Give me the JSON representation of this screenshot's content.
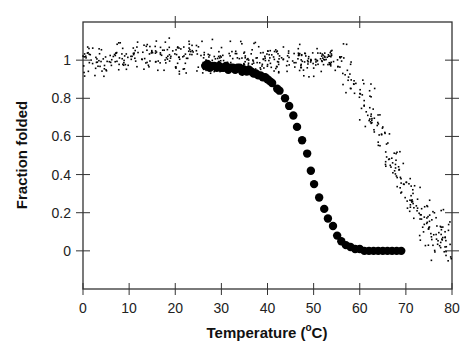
{
  "chart_data": {
    "type": "scatter",
    "title": "",
    "xlabel": "Temperature (°C)",
    "xlabel_parts": {
      "pre": "Temperature (",
      "sup": "o",
      "post": "C)"
    },
    "ylabel": "Fraction folded",
    "xlim": [
      0,
      80
    ],
    "ylim": [
      -0.2,
      1.2
    ],
    "xticks": [
      0,
      10,
      20,
      30,
      40,
      50,
      60,
      70,
      80
    ],
    "yticks": [
      0,
      0.2,
      0.4,
      0.6,
      0.8,
      1
    ],
    "ytick_labels": [
      "0",
      "0.2",
      "0.4",
      "0.6",
      "0.8",
      "1"
    ],
    "grid": false,
    "legend": null,
    "series": [
      {
        "name": "large-dots",
        "marker": "filled-circle-large",
        "color": "#000000",
        "x": [
          26.5,
          27.0,
          27.5,
          28.0,
          28.5,
          29.0,
          29.5,
          30.0,
          30.5,
          31.0,
          31.5,
          32.0,
          32.5,
          33.0,
          33.5,
          34.0,
          34.5,
          35.0,
          35.5,
          36.0,
          36.5,
          37.0,
          37.5,
          38.0,
          38.5,
          39.0,
          39.5,
          40.0,
          40.5,
          41.0,
          42.1,
          42.6,
          43.8,
          44.7,
          45.6,
          46.4,
          47.5,
          48.6,
          49.4,
          50.1,
          51.2,
          52.3,
          53.1,
          54.2,
          55.1,
          56.0,
          57.0,
          58.0,
          59.0,
          60.0,
          61.0,
          62.0,
          63.0,
          64.0,
          65.0,
          66.0,
          67.0,
          68.0,
          69.0
        ],
        "y": [
          0.97,
          0.98,
          0.96,
          0.97,
          0.97,
          0.96,
          0.97,
          0.96,
          0.96,
          0.97,
          0.95,
          0.96,
          0.96,
          0.95,
          0.96,
          0.96,
          0.94,
          0.95,
          0.94,
          0.95,
          0.94,
          0.93,
          0.93,
          0.92,
          0.92,
          0.91,
          0.91,
          0.9,
          0.89,
          0.88,
          0.85,
          0.84,
          0.8,
          0.76,
          0.71,
          0.65,
          0.58,
          0.51,
          0.42,
          0.35,
          0.28,
          0.22,
          0.17,
          0.13,
          0.08,
          0.05,
          0.03,
          0.02,
          0.01,
          0.01,
          0.0,
          0.0,
          0.0,
          0.0,
          0.0,
          0.0,
          0.0,
          0.0,
          0.0
        ]
      },
      {
        "name": "small-dots",
        "marker": "point-small",
        "color": "#000000",
        "description": "noisy melting curve, plateau ~1.0 to ~55 °C then sigmoidal decay to ~0 near 80 °C",
        "x_range": [
          0,
          80
        ],
        "n_points": 640,
        "midpoint_T": 67.5,
        "slope_width": 4.2,
        "noise_sd_plateau": 0.04,
        "noise_sd_transition": 0.07,
        "curve_samples": {
          "x": [
            0,
            10,
            20,
            30,
            40,
            50,
            55,
            58,
            60,
            62,
            64,
            66,
            68,
            70,
            72,
            74,
            76,
            78,
            80
          ],
          "y": [
            1.0,
            1.01,
            1.02,
            1.0,
            1.0,
            1.0,
            0.99,
            0.93,
            0.86,
            0.77,
            0.64,
            0.55,
            0.45,
            0.35,
            0.26,
            0.18,
            0.11,
            0.06,
            0.03
          ]
        }
      }
    ]
  }
}
